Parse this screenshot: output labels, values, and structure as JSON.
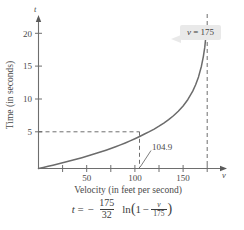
{
  "chart_data": {
    "type": "line",
    "title": "",
    "xlabel": "Velocity (in feet per second)",
    "ylabel": "Time (in seconds)",
    "x_axis_variable": "v",
    "y_axis_variable": "t",
    "xlim": [
      0,
      195
    ],
    "ylim": [
      0,
      24
    ],
    "grid": false,
    "legend_position": "none",
    "x_tick_labels": [
      "50",
      "100",
      "150"
    ],
    "x_tick_values": [
      50,
      100,
      150
    ],
    "x_minor_tick_values": [
      25,
      75,
      125,
      175
    ],
    "y_tick_labels": [
      "5",
      "10",
      "15",
      "20"
    ],
    "y_tick_values": [
      5,
      10,
      15,
      20
    ],
    "equation_description": "t = -(175/32) ln(1 - v/175)",
    "asymptote": {
      "type": "vertical",
      "value": 175,
      "label": "v = 175",
      "label_variable": "v",
      "label_equals": "=",
      "label_number": "175"
    },
    "annotation": {
      "label": "104.9",
      "x": 104.9,
      "y": 5,
      "guide_y_value": 5
    },
    "series": [
      {
        "name": "t = -(175/32) ln(1 - v/175)",
        "x": [
          0,
          5,
          10,
          15,
          20,
          25,
          30,
          35,
          40,
          45,
          50,
          55,
          60,
          65,
          70,
          75,
          80,
          85,
          90,
          95,
          100,
          104.9,
          110,
          115,
          120,
          125,
          130,
          135,
          140,
          145,
          150,
          155,
          160,
          163,
          166,
          169,
          171,
          172.5,
          173.5,
          174
        ],
        "values": [
          0,
          0.159,
          0.322,
          0.489,
          0.661,
          0.838,
          1.02,
          1.207,
          1.4,
          1.6,
          1.806,
          2.02,
          2.242,
          2.472,
          2.712,
          2.962,
          3.223,
          3.496,
          3.783,
          4.086,
          4.406,
          4.73,
          5.1,
          5.453,
          5.836,
          6.254,
          6.715,
          7.228,
          7.807,
          8.472,
          9.255,
          10.21,
          11.44,
          12.38,
          13.55,
          15.13,
          16.55,
          17.95,
          19.38,
          20.38
        ]
      }
    ]
  },
  "formula": {
    "lhs_variable": "t",
    "equals": "=",
    "minus": "−",
    "coefficient_numerator": "175",
    "coefficient_denominator": "32",
    "ln": "ln",
    "open_paren": "(",
    "one": "1",
    "inner_minus": "−",
    "inner_numerator": "v",
    "inner_denominator": "175",
    "close_paren": ")"
  }
}
